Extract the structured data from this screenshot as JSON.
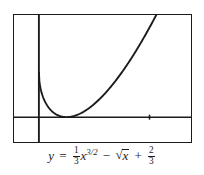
{
  "figure": {
    "frame": {
      "color": "#1b1b1b"
    },
    "background": "#ffffff",
    "axes": {
      "color": "#1b1b1b",
      "x_axis_label": "x-axis",
      "y_axis_label": "y-axis",
      "x_tick_positions": [
        4
      ]
    }
  },
  "caption": {
    "y": "y",
    "equals": "=",
    "frac1_num": "1",
    "frac1_den": "3",
    "x1": "x",
    "exponent": "3/2",
    "minus": "−",
    "radical_sign": "√",
    "x2": "x",
    "plus": "+",
    "frac2_num": "2",
    "frac2_den": "3",
    "plain": "y = 1/3 x^(3/2) - sqrt(x) + 2/3"
  },
  "chart_data": {
    "type": "line",
    "title": "",
    "xlabel": "",
    "ylabel": "",
    "equation": "y = (1/3)x^(3/2) - sqrt(x) + 2/3",
    "xlim": [
      -0.9,
      5.5
    ],
    "ylim": [
      -0.37,
      1.52
    ],
    "grid": false,
    "legend": null,
    "y_intercept": 0.667,
    "root_and_minimum": {
      "x": 1,
      "y": 0
    },
    "x_ticks": [
      4
    ],
    "x": [
      0,
      0.1,
      0.2,
      0.3,
      0.4,
      0.5,
      0.6,
      0.7,
      0.8,
      0.9,
      1.0,
      1.2,
      1.4,
      1.6,
      1.8,
      2.0,
      2.25,
      2.5,
      2.75,
      3.0,
      3.25,
      3.5,
      3.75,
      4.0,
      4.25,
      4.5,
      4.75,
      5.0,
      5.2
    ],
    "y": [
      0.667,
      0.368,
      0.243,
      0.162,
      0.103,
      0.061,
      0.031,
      0.011,
      0.001,
      0.0,
      0.0,
      0.019,
      0.056,
      0.107,
      0.169,
      0.24,
      0.343,
      0.455,
      0.575,
      0.7,
      0.83,
      0.964,
      1.101,
      1.24,
      1.382,
      1.525,
      1.67,
      1.816,
      1.934
    ],
    "series": [
      {
        "name": "y = (1/3)x^(3/2) - sqrt(x) + 2/3",
        "color": "#1b1b1b",
        "values": [
          0.667,
          0.368,
          0.243,
          0.162,
          0.103,
          0.061,
          0.031,
          0.011,
          0.001,
          0.0,
          0.0,
          0.019,
          0.056,
          0.107,
          0.169,
          0.24,
          0.343,
          0.455,
          0.575,
          0.7,
          0.83,
          0.964,
          1.101,
          1.24,
          1.382,
          1.525,
          1.67,
          1.816,
          1.934
        ]
      }
    ]
  }
}
